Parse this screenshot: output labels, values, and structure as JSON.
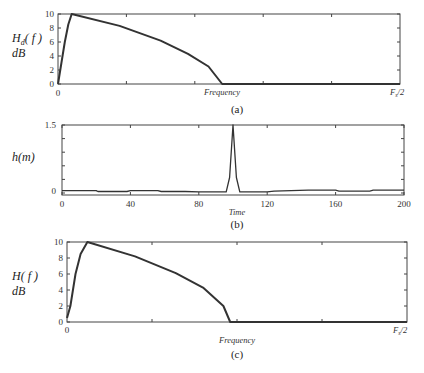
{
  "chart_data": [
    {
      "type": "line",
      "panel": "(a)",
      "title": "",
      "ylabel": "H_d(f) dB",
      "ylabel_line1": "H",
      "ylabel_sub": "d",
      "ylabel_fn": "( f )",
      "ylabel_line2": "dB",
      "xlabel": "Frequency",
      "x_end_label": "F_s/2",
      "x_tick_labels": [
        "0"
      ],
      "y_tick_labels": [
        "0",
        "2",
        "4",
        "6",
        "8",
        "10"
      ],
      "ylim": [
        0,
        10
      ],
      "xlim": [
        0,
        1
      ],
      "x": [
        0,
        0.01,
        0.02,
        0.03,
        0.04,
        0.18,
        0.3,
        0.38,
        0.44,
        0.48,
        1.0
      ],
      "values": [
        0,
        3,
        6,
        8.5,
        10,
        8.3,
        6.2,
        4.3,
        2.5,
        0,
        0
      ],
      "caption": "(a)"
    },
    {
      "type": "line",
      "panel": "(b)",
      "title": "",
      "ylabel": "h(m)",
      "xlabel": "Time",
      "x_tick_labels": [
        "0",
        "40",
        "80",
        "120",
        "160",
        "200"
      ],
      "x_ticks": [
        0,
        40,
        80,
        120,
        160,
        200
      ],
      "y_tick_labels": [
        "0",
        "1.5"
      ],
      "ylim": [
        -0.1,
        1.5
      ],
      "xlim": [
        0,
        200
      ],
      "x": [
        0,
        20,
        21,
        38,
        40,
        56,
        58,
        72,
        80,
        96,
        98,
        100,
        102,
        104,
        120,
        124,
        144,
        160,
        162,
        180,
        182,
        200
      ],
      "values": [
        0,
        0,
        -0.02,
        -0.02,
        0,
        0,
        -0.02,
        -0.02,
        -0.03,
        -0.03,
        0.3,
        1.5,
        0.3,
        -0.03,
        -0.03,
        -0.01,
        0.01,
        0.01,
        -0.01,
        -0.01,
        0.01,
        0.01
      ],
      "caption": "(b)"
    },
    {
      "type": "line",
      "panel": "(c)",
      "title": "",
      "ylabel": "H(f) dB",
      "ylabel_line1": "H",
      "ylabel_fn": "( f )",
      "ylabel_line2": "dB",
      "xlabel": "Frequency",
      "x_end_label": "F_s/2",
      "x_tick_labels": [
        "0"
      ],
      "y_tick_labels": [
        "0",
        "2",
        "4",
        "6",
        "8",
        "10"
      ],
      "ylim": [
        0,
        10
      ],
      "xlim": [
        0,
        1
      ],
      "x": [
        0,
        0.01,
        0.025,
        0.04,
        0.06,
        0.2,
        0.32,
        0.4,
        0.46,
        0.48,
        1.0
      ],
      "values": [
        0.5,
        2,
        6,
        8.5,
        10,
        8.2,
        6.1,
        4.3,
        2,
        0,
        0
      ],
      "caption": "(c)"
    }
  ]
}
